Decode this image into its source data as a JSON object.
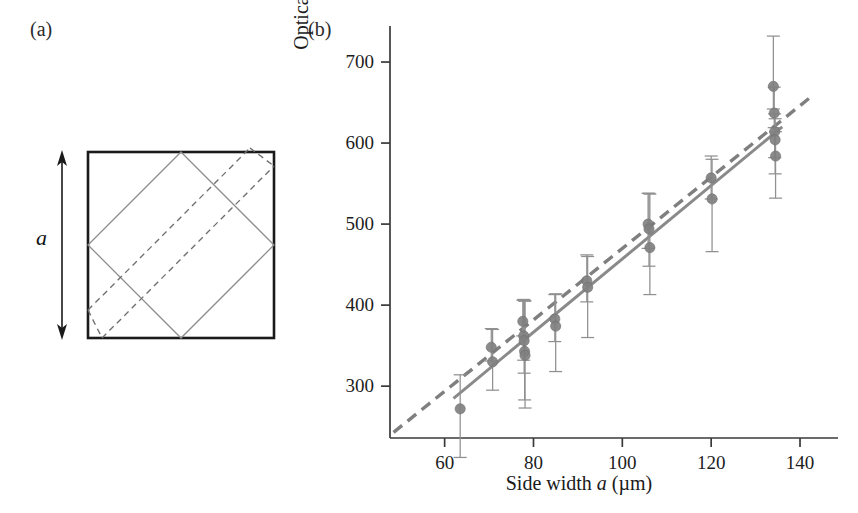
{
  "figure": {
    "panel_a_label": "(a)",
    "panel_b_label": "(b)",
    "background": "#ffffff"
  },
  "panel_a": {
    "name": "square-cavity-schematic",
    "dimension_label": "a",
    "outer_square": {
      "stroke": "#1a1a1a",
      "stroke_width": 2.6,
      "x": 88,
      "y": 152,
      "size": 186
    },
    "inscribed_square": {
      "stroke": "#8a8a8a",
      "stroke_width": 1.2,
      "style": "solid",
      "description": "45-degree rotated square inscribed in the outer square"
    },
    "dashed_band": {
      "stroke": "#6f6f6f",
      "stroke_width": 1.3,
      "style": "dashed",
      "dash": "6,4",
      "description": "two parallel dashed diagonal lines forming a shifted square path"
    },
    "arrow": {
      "stroke": "#1a1a1a",
      "double_headed": true,
      "x": 62,
      "y_top": 152,
      "y_bottom": 338
    }
  },
  "chart_data": {
    "type": "scatter",
    "title": "",
    "xlabel": "Side width a (µm)",
    "ylabel": "Optical length (µm)",
    "xlim": [
      47.7,
      144.5
    ],
    "ylim": [
      236,
      742
    ],
    "xticks": [
      60,
      80,
      100,
      120,
      140
    ],
    "xtick_labels": [
      "60",
      "80",
      "100",
      "120",
      "140"
    ],
    "yticks": [
      300,
      400,
      500,
      600,
      700
    ],
    "ytick_labels": [
      "300",
      "400",
      "500",
      "600",
      "700"
    ],
    "grid": false,
    "legend": null,
    "marker_color": "#808080",
    "errorbar_color": "#909090",
    "fit_line_solid": {
      "color": "#8a8a8a",
      "style": "solid",
      "width": 3,
      "x0": 62,
      "y0": 285,
      "x1": 136,
      "y1": 620
    },
    "fit_line_dashed": {
      "color": "#7f7f7f",
      "style": "dashed",
      "width": 3.4,
      "dash": "11,7",
      "x0": 48.5,
      "y0": 243,
      "x1": 142,
      "y1": 655
    },
    "points": [
      {
        "x": 63.5,
        "y": 272,
        "yerr_low": 60,
        "yerr_high": 42
      },
      {
        "x": 70.5,
        "y": 348,
        "yerr_low": 17,
        "yerr_high": 23
      },
      {
        "x": 70.8,
        "y": 330,
        "yerr_low": 35,
        "yerr_high": 40
      },
      {
        "x": 77.6,
        "y": 380,
        "yerr_low": 18,
        "yerr_high": 26
      },
      {
        "x": 77.8,
        "y": 362,
        "yerr_low": 30,
        "yerr_high": 45
      },
      {
        "x": 77.9,
        "y": 356,
        "yerr_low": 40,
        "yerr_high": 50
      },
      {
        "x": 78.0,
        "y": 343,
        "yerr_low": 60,
        "yerr_high": 62
      },
      {
        "x": 78.1,
        "y": 338,
        "yerr_low": 65,
        "yerr_high": 67
      },
      {
        "x": 84.8,
        "y": 383,
        "yerr_low": 28,
        "yerr_high": 30
      },
      {
        "x": 85.0,
        "y": 374,
        "yerr_low": 56,
        "yerr_high": 40
      },
      {
        "x": 92.0,
        "y": 430,
        "yerr_low": 26,
        "yerr_high": 32
      },
      {
        "x": 92.2,
        "y": 422,
        "yerr_low": 62,
        "yerr_high": 38
      },
      {
        "x": 105.8,
        "y": 500,
        "yerr_low": 30,
        "yerr_high": 38
      },
      {
        "x": 106.0,
        "y": 494,
        "yerr_low": 46,
        "yerr_high": 44
      },
      {
        "x": 106.2,
        "y": 471,
        "yerr_low": 58,
        "yerr_high": 66
      },
      {
        "x": 120.0,
        "y": 557,
        "yerr_low": 26,
        "yerr_high": 27
      },
      {
        "x": 120.2,
        "y": 531,
        "yerr_low": 65,
        "yerr_high": 49
      },
      {
        "x": 134.0,
        "y": 670,
        "yerr_low": 28,
        "yerr_high": 62
      },
      {
        "x": 134.2,
        "y": 637,
        "yerr_low": 18,
        "yerr_high": 32
      },
      {
        "x": 134.3,
        "y": 614,
        "yerr_low": 32,
        "yerr_high": 22
      },
      {
        "x": 134.4,
        "y": 604,
        "yerr_low": 42,
        "yerr_high": 26
      },
      {
        "x": 134.5,
        "y": 584,
        "yerr_low": 52,
        "yerr_high": 30
      }
    ]
  }
}
